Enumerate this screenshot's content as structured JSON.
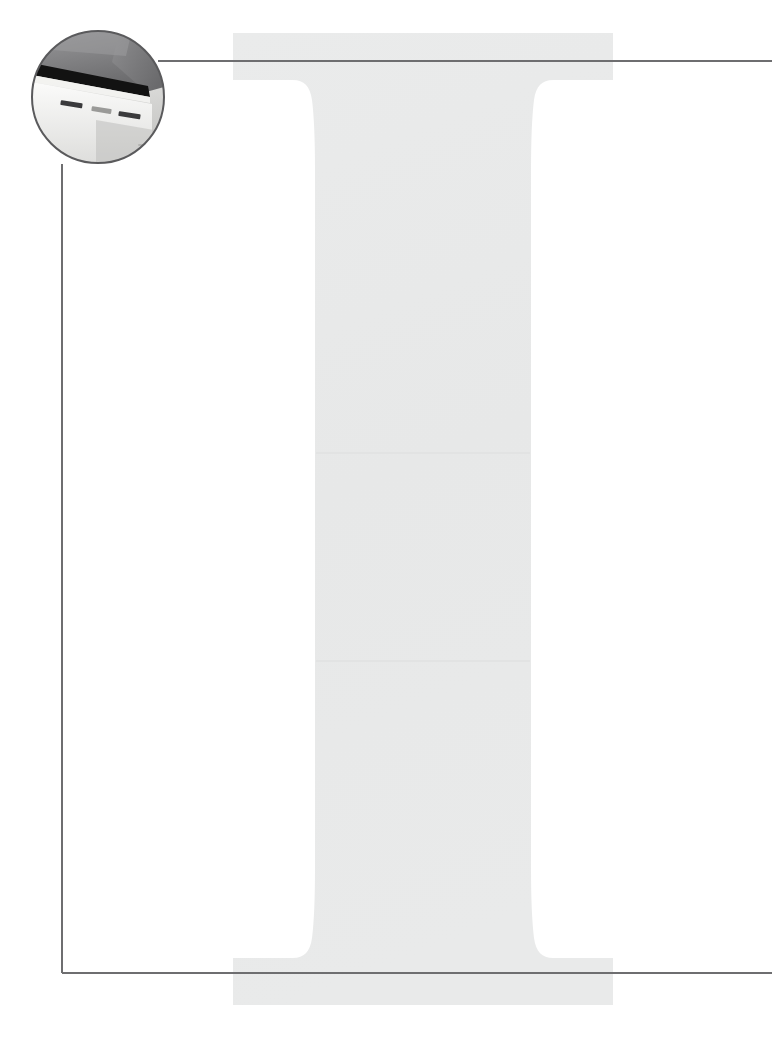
{
  "page": {
    "width": 772,
    "height": 1040,
    "background_color": "#FFFFFF",
    "kind": "chapter-opening-spread"
  },
  "drop_cap": {
    "letter": "I",
    "style": "serif-slab-with-bracketed-serifs",
    "fill_color": "#E8E9E9",
    "seam_color": "#E2E3E3",
    "bounds": {
      "x": 233,
      "y": 33,
      "width": 380,
      "height": 972
    },
    "top_serif": {
      "x": 233,
      "y": 33,
      "width": 380,
      "height": 47
    },
    "bottom_serif": {
      "x": 233,
      "y": 958,
      "width": 380,
      "height": 47
    },
    "stem": {
      "x": 333,
      "y": 80,
      "width": 197,
      "height": 878
    }
  },
  "callout": {
    "line_color": "#6E6E70",
    "line_width": 2,
    "top_leader": {
      "label": "top-leader-line",
      "x1": 158,
      "y1": 61,
      "x2": 772,
      "y2": 61
    },
    "vertical_leader": {
      "label": "vertical-leader-line",
      "x1": 62,
      "y1": 164,
      "x2": 62,
      "y2": 973
    },
    "bottom_leader": {
      "label": "bottom-leader-line",
      "x1": 62,
      "y1": 973,
      "x2": 772,
      "y2": 973
    }
  },
  "photo_inset": {
    "shape": "circle",
    "label": "magnified device detail",
    "center_x": 98,
    "center_y": 97,
    "radius": 66,
    "border_color": "#5A5A5C",
    "border_width": 2,
    "subject": "laptop screen bezel and port slots",
    "colors": {
      "screen_upper": "#8A8A8C",
      "screen_lower": "#6F6F71",
      "bezel_black": "#121212",
      "body_light": "#E6E6E4",
      "body_shadow": "#C9C9C7",
      "slot_dark": "#3A3A3C",
      "highlight": "#F4F4F2"
    },
    "slots": [
      {
        "label": "slot-1"
      },
      {
        "label": "slot-2"
      },
      {
        "label": "slot-3"
      }
    ]
  }
}
